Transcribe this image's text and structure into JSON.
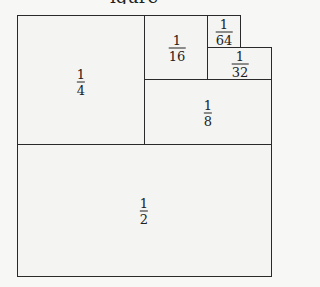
{
  "title_fragment": "igure",
  "regions": [
    {
      "id": "half",
      "num": "1",
      "den": "2"
    },
    {
      "id": "quarter",
      "num": "1",
      "den": "4"
    },
    {
      "id": "eighth",
      "num": "1",
      "den": "8"
    },
    {
      "id": "sixteenth",
      "num": "1",
      "den": "16"
    },
    {
      "id": "thirtysecond",
      "num": "1",
      "den": "32"
    },
    {
      "id": "sixtyfourth",
      "num": "1",
      "den": "64"
    }
  ],
  "colors": {
    "line": "#2a2a2a",
    "fill": "#f4f4f2"
  }
}
